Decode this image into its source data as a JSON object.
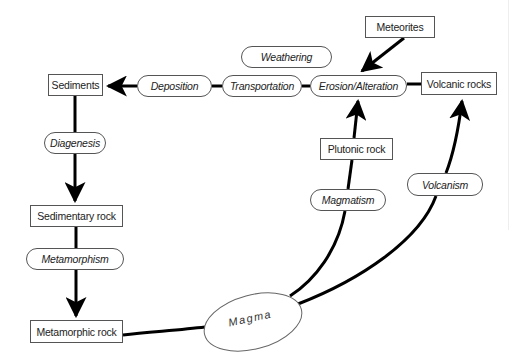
{
  "diagram": {
    "colors": {
      "line": "#000000",
      "border": "#555555",
      "text": "#222222",
      "background": "#ffffff"
    },
    "rocks": {
      "meteorites": "Meteorites",
      "sediments": "Sediments",
      "volcanic_rocks": "Volcanic rocks",
      "sedimentary_rock": "Sedimentary rock",
      "plutonic_rock": "Plutonic rock",
      "metamorphic_rock": "Metamorphic rock",
      "magma": "Magma"
    },
    "processes": {
      "weathering": "Weathering",
      "deposition": "Deposition",
      "transportation": "Transportation",
      "erosion_alteration": "Erosion/Alteration",
      "diagenesis": "Diagenesis",
      "metamorphism": "Metamorphism",
      "magmatism": "Magmatism",
      "volcanism": "Volcanism"
    },
    "edges": [
      {
        "from": "Meteorites",
        "to": "Erosion/Alteration",
        "arrow": true
      },
      {
        "from": "Volcanic rocks",
        "to": "Erosion/Alteration",
        "arrow": false
      },
      {
        "from": "Erosion/Alteration",
        "to": "Transportation",
        "arrow": false
      },
      {
        "from": "Transportation",
        "to": "Deposition",
        "arrow": false
      },
      {
        "from": "Deposition",
        "to": "Sediments",
        "arrow": true
      },
      {
        "from": "Sediments",
        "to": "Sedimentary rock",
        "via": "Diagenesis",
        "arrow": true
      },
      {
        "from": "Sedimentary rock",
        "to": "Metamorphic rock",
        "via": "Metamorphism",
        "arrow": true
      },
      {
        "from": "Metamorphic rock",
        "to": "Magma",
        "arrow": false
      },
      {
        "from": "Magma",
        "to": "Erosion/Alteration",
        "via": "Magmatism, Plutonic rock",
        "arrow": true
      },
      {
        "from": "Magma",
        "to": "Volcanic rocks",
        "via": "Volcanism",
        "arrow": true
      }
    ]
  }
}
